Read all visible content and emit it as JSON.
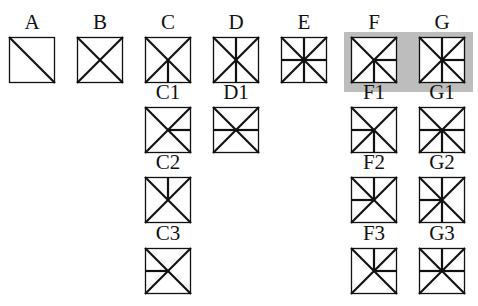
{
  "highlight": {
    "x": 344,
    "y": 32,
    "w": 129,
    "h": 60,
    "color": "#bdbdbd"
  },
  "square_size": 46,
  "line_color": "#111111",
  "cells": [
    {
      "label": "A",
      "x": 9,
      "y": 37,
      "lines": [
        "d1"
      ]
    },
    {
      "label": "B",
      "x": 77,
      "y": 37,
      "lines": [
        "d1",
        "d2"
      ]
    },
    {
      "label": "C",
      "x": 145,
      "y": 37,
      "lines": [
        "d1",
        "d2",
        "vb"
      ]
    },
    {
      "label": "D",
      "x": 213,
      "y": 37,
      "lines": [
        "d1",
        "d2",
        "vt",
        "vb"
      ]
    },
    {
      "label": "E",
      "x": 281,
      "y": 37,
      "lines": [
        "d1",
        "d2",
        "vt",
        "vb",
        "hl",
        "hr"
      ]
    },
    {
      "label": "F",
      "x": 351,
      "y": 37,
      "lines": [
        "d1",
        "d2",
        "hr",
        "vb"
      ]
    },
    {
      "label": "G",
      "x": 419,
      "y": 37,
      "lines": [
        "d1",
        "d2",
        "vt",
        "vb",
        "hr"
      ]
    },
    {
      "label": "C1",
      "x": 145,
      "y": 107,
      "lines": [
        "d1",
        "d2",
        "hr"
      ]
    },
    {
      "label": "D1",
      "x": 213,
      "y": 107,
      "lines": [
        "d1",
        "d2",
        "hl",
        "hr"
      ]
    },
    {
      "label": "F1",
      "x": 351,
      "y": 107,
      "lines": [
        "d1",
        "d2",
        "hl",
        "vb"
      ]
    },
    {
      "label": "G1",
      "x": 419,
      "y": 107,
      "lines": [
        "d1",
        "d2",
        "hl",
        "hr",
        "vb"
      ]
    },
    {
      "label": "C2",
      "x": 145,
      "y": 177,
      "lines": [
        "d1",
        "d2",
        "vt"
      ]
    },
    {
      "label": "F2",
      "x": 351,
      "y": 177,
      "lines": [
        "d1",
        "d2",
        "hl",
        "vt"
      ]
    },
    {
      "label": "G2",
      "x": 419,
      "y": 177,
      "lines": [
        "d1",
        "d2",
        "vt",
        "vb",
        "hl"
      ]
    },
    {
      "label": "C3",
      "x": 145,
      "y": 248,
      "lines": [
        "d1",
        "d2",
        "hl"
      ]
    },
    {
      "label": "F3",
      "x": 351,
      "y": 248,
      "lines": [
        "d1",
        "d2",
        "vt",
        "hr"
      ]
    },
    {
      "label": "G3",
      "x": 419,
      "y": 248,
      "lines": [
        "d1",
        "d2",
        "hl",
        "hr",
        "vt"
      ]
    }
  ]
}
